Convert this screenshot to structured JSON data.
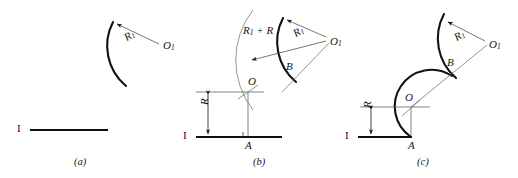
{
  "figure": {
    "stroke_color": "#1a1a1a",
    "thin_color": "#4a4a4a",
    "panels": [
      {
        "id": "a",
        "caption": "(a)",
        "labels": {
          "line": "I",
          "radius_arc": "R",
          "radius_arc_sub": "1",
          "center_arc": "O",
          "center_arc_sub": "1"
        }
      },
      {
        "id": "b",
        "caption": "(b)",
        "labels": {
          "line": "I",
          "radius_arc": "R",
          "radius_arc_sub": "1",
          "center_arc": "O",
          "center_arc_sub": "1",
          "sum_radius": "R",
          "sum_radius_sub": "1",
          "sum_radius_tail": " + R",
          "offset_distance": "R",
          "center_fillet": "O",
          "tangent_point_arc": "B",
          "tangent_point_line": "A"
        }
      },
      {
        "id": "c",
        "caption": "(c)",
        "labels": {
          "line": "I",
          "radius_arc": "R",
          "radius_arc_sub": "1",
          "center_arc": "O",
          "center_arc_sub": "1",
          "offset_distance": "R",
          "center_fillet": "O",
          "tangent_point_arc": "B",
          "tangent_point_line": "A"
        }
      }
    ]
  }
}
